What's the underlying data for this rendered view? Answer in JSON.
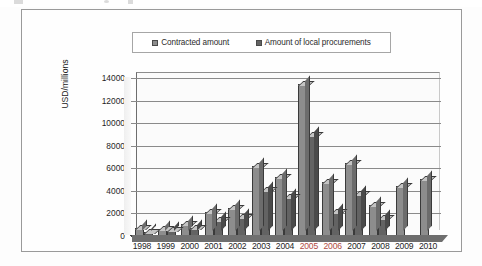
{
  "figure": {
    "y_axis_title": "USD/millions",
    "legend": [
      {
        "label": "Contracted amount",
        "swatch_color": "#8d8d8d",
        "icon": "square-swatch-icon"
      },
      {
        "label": "Amount of local procurements",
        "swatch_color": "#636363",
        "icon": "square-swatch-icon"
      }
    ]
  },
  "chart_data": {
    "type": "bar",
    "title": "",
    "subtitle": "",
    "xlabel": "",
    "ylabel": "USD/millions",
    "ylim": [
      0,
      14000
    ],
    "ytick_labels": [
      "0",
      "2000",
      "4000",
      "6000",
      "8000",
      "10000",
      "12000",
      "14000"
    ],
    "yticks": [
      0,
      2000,
      4000,
      6000,
      8000,
      10000,
      12000,
      14000
    ],
    "grid": true,
    "grid_axis": "y",
    "legend_position": "top-center",
    "style": "3d-clustered-column",
    "categories": [
      "1998",
      "1999",
      "2000",
      "2001",
      "2002",
      "2003",
      "2004",
      "2005",
      "2006",
      "2007",
      "2008",
      "2009",
      "2010"
    ],
    "highlighted_categories": [
      "2005",
      "2006"
    ],
    "highlight_color": "#b04a42",
    "series": [
      {
        "name": "Contracted amount",
        "color": "#8d8d8d",
        "values": [
          600,
          550,
          950,
          2000,
          2350,
          6100,
          5100,
          13400,
          4700,
          6400,
          2650,
          4350,
          4950
        ]
      },
      {
        "name": "Amount of local procurements",
        "color": "#636363",
        "values": [
          300,
          450,
          600,
          1300,
          1600,
          4000,
          3400,
          8900,
          2050,
          3600,
          1550,
          0,
          0
        ]
      }
    ]
  }
}
